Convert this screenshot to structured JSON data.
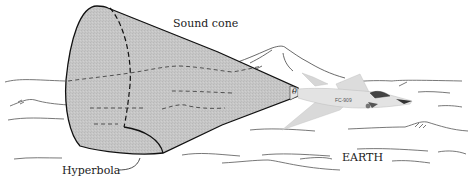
{
  "diagram": {
    "labels": {
      "sound_cone": "Sound cone",
      "hyperbola": "Hyperbola",
      "earth": "EARTH",
      "angle": "θ",
      "aircraft_marking": "FC-909"
    },
    "elements": [
      {
        "id": "sound-cone",
        "type": "cone",
        "fill": "#c4c4c4",
        "stroke": "#111111"
      },
      {
        "id": "hyperbola-curve",
        "type": "curve",
        "style": "dashed"
      },
      {
        "id": "jet-aircraft",
        "type": "illustration",
        "fill": "#e2e2e2"
      },
      {
        "id": "mountain",
        "type": "outline-sketch"
      },
      {
        "id": "terrain-lines",
        "type": "sketch-lines"
      }
    ],
    "colors": {
      "cone_fill": "#c4c4c4",
      "outline": "#111111",
      "terrain": "#444444",
      "jet": "#e0e0e0",
      "background": "#ffffff"
    }
  }
}
